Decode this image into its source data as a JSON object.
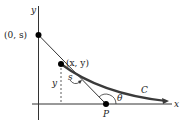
{
  "diagram": {
    "axes": {
      "x_label": "x",
      "y_label": "y"
    },
    "points": {
      "start": {
        "label": "(0, s)"
      },
      "current": {
        "label": "(x, y)"
      },
      "tangent_intercept": {
        "label": "P"
      }
    },
    "curve_label": "C",
    "arc_label": "s",
    "height_label": "y",
    "angle_label": "θ",
    "colors": {
      "curve": "#3a3a3a",
      "axis": "#333333",
      "tangent": "#333333"
    }
  }
}
